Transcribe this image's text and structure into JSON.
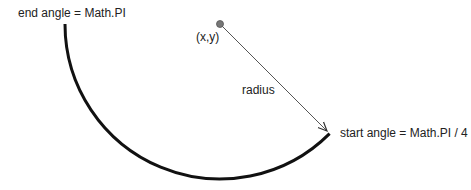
{
  "diagram": {
    "labels": {
      "end_angle": "end angle = Math.PI",
      "center": "(x,y)",
      "radius": "radius",
      "start_angle": "start angle = Math.PI / 4"
    },
    "geometry": {
      "center": [
        220,
        24
      ],
      "radius": 155,
      "start_angle": "Math.PI / 4",
      "end_angle": "Math.PI"
    },
    "colors": {
      "arc": "#111111",
      "radius_line": "#555555",
      "center_dot": "#777777",
      "text": "#222222"
    }
  }
}
